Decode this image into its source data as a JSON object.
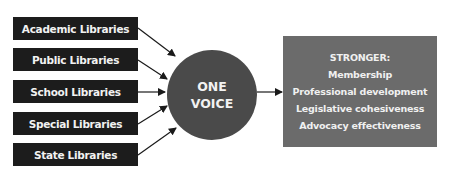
{
  "diagram": {
    "inputs": [
      {
        "label": "Academic Libraries"
      },
      {
        "label": "Public Libraries"
      },
      {
        "label": "School Libraries"
      },
      {
        "label": "Special Libraries"
      },
      {
        "label": "State Libraries"
      }
    ],
    "center": {
      "line1": "ONE",
      "line2": "VOICE"
    },
    "result": {
      "heading": "STRONGER:",
      "items": [
        "Membership",
        "Professional development",
        "Legislative cohesiveness",
        "Advocacy effectiveness"
      ]
    },
    "colors": {
      "input_box": "#1c1c1c",
      "center_circle": "#4a4a4a",
      "result_box": "#6b6b6b",
      "arrows": "#1a1a1a"
    }
  }
}
